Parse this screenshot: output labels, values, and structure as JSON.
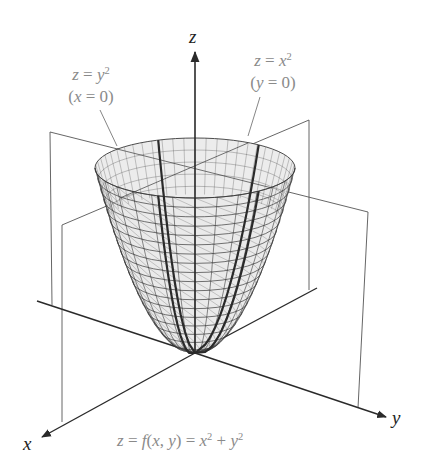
{
  "figure": {
    "colors": {
      "axis": "#2a2a2a",
      "plane": "#555555",
      "mesh": "#3a3a3a",
      "mesh_fill": "#e6e6e6",
      "trace": "#2a2a2a",
      "label_gray": "#8a8a8a",
      "label_dark": "#222222"
    }
  },
  "axes": {
    "z": {
      "label": "z"
    },
    "x": {
      "label": "x"
    },
    "y": {
      "label": "y"
    }
  },
  "annotations": {
    "left": {
      "line1_lhs": "z",
      "line1_eq": " = ",
      "line1_var": "y",
      "line1_exp": "2",
      "line2_open": "(",
      "line2_var": "x",
      "line2_rest": " = 0)"
    },
    "right": {
      "line1_lhs": "z",
      "line1_eq": " = ",
      "line1_var": "x",
      "line1_exp": "2",
      "line2_open": "(",
      "line2_var": "y",
      "line2_rest": " = 0)"
    }
  },
  "caption": {
    "z": "z",
    "eq1": " = ",
    "f": "f",
    "open": "(",
    "x": "x",
    "comma": ", ",
    "y": "y",
    "close": ")",
    "eq2": " = ",
    "x2": "x",
    "exp1": "2",
    "plus": " + ",
    "y2": "y",
    "exp2": "2"
  }
}
